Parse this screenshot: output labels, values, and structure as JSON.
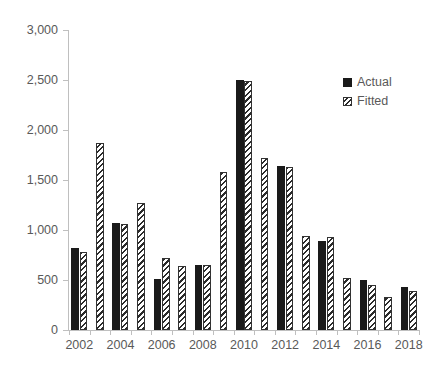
{
  "chart_data": {
    "type": "bar",
    "title": "",
    "subtitle": "",
    "xlabel": "",
    "ylabel": "",
    "grid": false,
    "legend_position": "top-right",
    "ylim": [
      0,
      3000
    ],
    "ytick_values": [
      0,
      500,
      1000,
      1500,
      2000,
      2500,
      3000
    ],
    "ytick_labels": [
      "0",
      "500",
      "1,000",
      "1,500",
      "2,000",
      "2,500",
      "3,000"
    ],
    "categories": [
      "2002",
      "2003",
      "2004",
      "2005",
      "2006",
      "2007",
      "2008",
      "2009",
      "2010",
      "2011",
      "2012",
      "2013",
      "2014",
      "2015",
      "2016",
      "2017",
      "2018"
    ],
    "xtick_labels_shown": [
      "2002",
      "2004",
      "2006",
      "2008",
      "2010",
      "2012",
      "2014",
      "2016",
      "2018"
    ],
    "series": [
      {
        "name": "Actual",
        "style": "solid-black",
        "color": "#1a1a1a",
        "values": [
          820,
          null,
          1070,
          null,
          510,
          null,
          650,
          null,
          2505,
          null,
          1640,
          null,
          890,
          null,
          500,
          null,
          430
        ]
      },
      {
        "name": "Fitted",
        "style": "diagonal-hatch",
        "color": "#333333",
        "values": [
          780,
          1870,
          1060,
          1270,
          720,
          640,
          655,
          1580,
          2490,
          1725,
          1630,
          940,
          935,
          525,
          450,
          330,
          395
        ]
      }
    ]
  },
  "legend": {
    "items": [
      {
        "label": "Actual",
        "key": "solid-square-icon"
      },
      {
        "label": "Fitted",
        "key": "hatched-square-icon"
      }
    ]
  }
}
